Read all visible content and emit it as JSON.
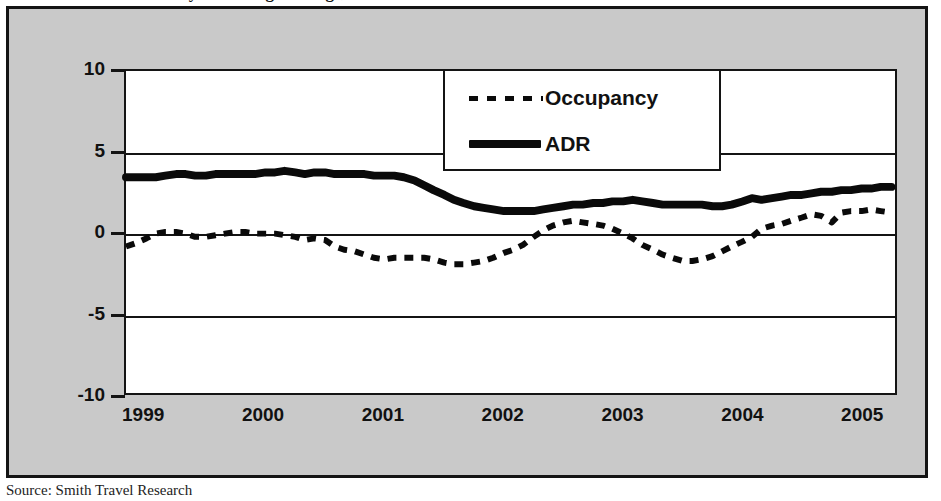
{
  "figure": {
    "title_partial": "Monthly Percentage Change, Year-to-Date",
    "source_note": "Source: Smith Travel Research",
    "background_color": "#c9c9c9",
    "plot_background_color": "#ffffff",
    "line_color": "#0a0a0a"
  },
  "legend": {
    "position": "top-center-right",
    "entries": [
      {
        "label": "Occupancy",
        "style": "dashed",
        "swatch": "dashed-line-swatch"
      },
      {
        "label": "ADR",
        "style": "solid",
        "swatch": "solid-line-swatch"
      }
    ]
  },
  "axes": {
    "y_ticks": [
      "10",
      "5",
      "0",
      "-5",
      "-10"
    ],
    "y_values": [
      10,
      5,
      0,
      -5,
      -10
    ],
    "x_ticks": [
      "1999",
      "2000",
      "2001",
      "2002",
      "2003",
      "2004",
      "2005"
    ],
    "x_values": [
      1999,
      2000,
      2001,
      2002,
      2003,
      2004,
      2005
    ]
  },
  "chart_data": {
    "type": "line",
    "title": "Monthly Percentage Change, Year-to-Date",
    "xlabel": "",
    "ylabel": "",
    "ylim": [
      -10,
      10
    ],
    "xlim": [
      1999.0,
      2005.45
    ],
    "grid": true,
    "legend_position": "upper center",
    "annotations": [
      "Source: Smith Travel Research"
    ],
    "series": [
      {
        "name": "Occupancy",
        "style": "dashed",
        "x": [
          1999.0,
          1999.08,
          1999.17,
          1999.25,
          1999.33,
          1999.42,
          1999.5,
          1999.58,
          1999.67,
          1999.75,
          1999.83,
          1999.92,
          2000.0,
          2000.08,
          2000.17,
          2000.25,
          2000.33,
          2000.42,
          2000.5,
          2000.58,
          2000.67,
          2000.75,
          2000.83,
          2000.92,
          2001.0,
          2001.08,
          2001.17,
          2001.25,
          2001.33,
          2001.42,
          2001.5,
          2001.58,
          2001.67,
          2001.75,
          2001.83,
          2001.92,
          2002.0,
          2002.08,
          2002.17,
          2002.25,
          2002.33,
          2002.42,
          2002.5,
          2002.58,
          2002.67,
          2002.75,
          2002.83,
          2002.92,
          2003.0,
          2003.08,
          2003.17,
          2003.25,
          2003.33,
          2003.42,
          2003.5,
          2003.58,
          2003.67,
          2003.75,
          2003.83,
          2003.92,
          2004.0,
          2004.08,
          2004.17,
          2004.25,
          2004.33,
          2004.42,
          2004.5,
          2004.58,
          2004.67,
          2004.75,
          2004.83,
          2004.92,
          2005.0,
          2005.08,
          2005.17,
          2005.25,
          2005.33,
          2005.42
        ],
        "values": [
          -0.9,
          -0.7,
          -0.4,
          -0.1,
          0.0,
          0.0,
          -0.1,
          -0.3,
          -0.3,
          -0.2,
          -0.1,
          0.0,
          0.0,
          -0.1,
          -0.1,
          -0.1,
          -0.2,
          -0.3,
          -0.5,
          -0.4,
          -0.5,
          -0.9,
          -1.1,
          -1.2,
          -1.4,
          -1.6,
          -1.7,
          -1.6,
          -1.6,
          -1.6,
          -1.6,
          -1.7,
          -1.9,
          -2.0,
          -2.0,
          -1.9,
          -1.8,
          -1.6,
          -1.3,
          -1.1,
          -0.8,
          -0.3,
          0.1,
          0.4,
          0.6,
          0.7,
          0.6,
          0.5,
          0.4,
          0.2,
          -0.1,
          -0.4,
          -0.8,
          -1.1,
          -1.4,
          -1.6,
          -1.8,
          -1.8,
          -1.7,
          -1.5,
          -1.2,
          -0.9,
          -0.6,
          -0.3,
          0.2,
          0.4,
          0.5,
          0.7,
          0.9,
          1.1,
          1.0,
          0.6,
          1.2,
          1.3,
          1.3,
          1.4,
          1.3,
          1.2
        ]
      },
      {
        "name": "ADR",
        "style": "solid",
        "x": [
          1999.0,
          1999.08,
          1999.17,
          1999.25,
          1999.33,
          1999.42,
          1999.5,
          1999.58,
          1999.67,
          1999.75,
          1999.83,
          1999.92,
          2000.0,
          2000.08,
          2000.17,
          2000.25,
          2000.33,
          2000.42,
          2000.5,
          2000.58,
          2000.67,
          2000.75,
          2000.83,
          2000.92,
          2001.0,
          2001.08,
          2001.17,
          2001.25,
          2001.33,
          2001.42,
          2001.5,
          2001.58,
          2001.67,
          2001.75,
          2001.83,
          2001.92,
          2002.0,
          2002.08,
          2002.17,
          2002.25,
          2002.33,
          2002.42,
          2002.5,
          2002.58,
          2002.67,
          2002.75,
          2002.83,
          2002.92,
          2003.0,
          2003.08,
          2003.17,
          2003.25,
          2003.33,
          2003.42,
          2003.5,
          2003.58,
          2003.67,
          2003.75,
          2003.83,
          2003.92,
          2004.0,
          2004.08,
          2004.17,
          2004.25,
          2004.33,
          2004.42,
          2004.5,
          2004.58,
          2004.67,
          2004.75,
          2004.83,
          2004.92,
          2005.0,
          2005.08,
          2005.17,
          2005.25,
          2005.33,
          2005.42
        ],
        "values": [
          3.4,
          3.4,
          3.4,
          3.4,
          3.5,
          3.6,
          3.6,
          3.5,
          3.5,
          3.6,
          3.6,
          3.6,
          3.6,
          3.6,
          3.7,
          3.7,
          3.8,
          3.7,
          3.6,
          3.7,
          3.7,
          3.6,
          3.6,
          3.6,
          3.6,
          3.5,
          3.5,
          3.5,
          3.4,
          3.2,
          2.9,
          2.6,
          2.3,
          2.0,
          1.8,
          1.6,
          1.5,
          1.4,
          1.3,
          1.3,
          1.3,
          1.3,
          1.4,
          1.5,
          1.6,
          1.7,
          1.7,
          1.8,
          1.8,
          1.9,
          1.9,
          2.0,
          1.9,
          1.8,
          1.7,
          1.7,
          1.7,
          1.7,
          1.7,
          1.6,
          1.6,
          1.7,
          1.9,
          2.1,
          2.0,
          2.1,
          2.2,
          2.3,
          2.3,
          2.4,
          2.5,
          2.5,
          2.6,
          2.6,
          2.7,
          2.7,
          2.8,
          2.8
        ]
      }
    ]
  }
}
